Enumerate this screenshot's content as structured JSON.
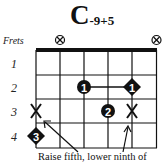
{
  "chord": {
    "root": "C",
    "extension": "-9+5"
  },
  "frets_label": "Frets",
  "fret_numbers": [
    "1",
    "2",
    "3",
    "4"
  ],
  "muted_strings": {
    "symbol": "circled-x",
    "strings": [
      2,
      6
    ]
  },
  "finger_markers": [
    {
      "string": 3,
      "fret": 2,
      "finger": "1",
      "shape": "circle"
    },
    {
      "string": 5,
      "fret": 2,
      "finger": "1",
      "shape": "diamond"
    },
    {
      "string": 4,
      "fret": 3,
      "finger": "2",
      "shape": "circle"
    },
    {
      "string": 1,
      "fret": 4,
      "finger": "3",
      "shape": "diamond"
    }
  ],
  "barre": {
    "from_string": 3,
    "to_string": 5,
    "fret": 2
  },
  "x_markers": [
    {
      "string": 1,
      "fret": 3
    },
    {
      "string": 5,
      "fret": 3
    }
  ],
  "caption": "Raise fifth, lower ninth of",
  "colors": {
    "ink": "#111111",
    "background": "#ffffff"
  }
}
